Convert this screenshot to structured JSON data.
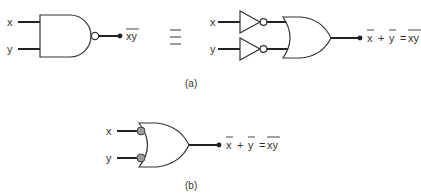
{
  "figure": {
    "part_a": {
      "caption": "(a)",
      "left": {
        "gate": "NAND",
        "inputs": [
          "x",
          "y"
        ],
        "output_label": "xy",
        "output_overline": true
      },
      "equivalence_symbol": "≡",
      "right": {
        "inverters": [
          {
            "input": "x"
          },
          {
            "input": "y"
          }
        ],
        "gate": "OR",
        "output_label": {
          "term1": "x",
          "plus": "+",
          "term2": "y",
          "equals": "=",
          "result": "xy"
        }
      }
    },
    "part_b": {
      "caption": "(b)",
      "gate": "OR with inverted (bubbled) inputs",
      "inputs": [
        "x",
        "y"
      ],
      "output_label": {
        "term1": "x",
        "plus": "+",
        "term2": "y",
        "equals": "=",
        "result": "xy"
      }
    },
    "colors": {
      "line": "#222222",
      "bubble_fill_b": "#9a9a9a",
      "background": "#ffffff"
    }
  }
}
